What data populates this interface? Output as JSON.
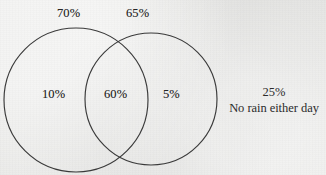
{
  "figure": {
    "name": "venn-diagram-rain-probability",
    "type": "venn-two-set",
    "background_color": "#ebebe9",
    "stroke_color": "#3a3a3a"
  },
  "labels": {
    "set_a_total": "70%",
    "set_b_total": "65%",
    "a_only": "10%",
    "intersection": "60%",
    "b_only": "5%",
    "outside_value": "25%",
    "outside_caption": "No rain either day"
  },
  "chart_data": {
    "type": "venn",
    "sets": [
      {
        "name": "set-a",
        "label": "70%",
        "total": 70,
        "only": 10
      },
      {
        "name": "set-b",
        "label": "65%",
        "total": 65,
        "only": 5
      }
    ],
    "intersection": 60,
    "outside": 25,
    "outside_label": "No rain either day",
    "units": "percent"
  },
  "geometry": {
    "left_circle": {
      "cx": 76,
      "cy": 100,
      "r": 72
    },
    "right_circle": {
      "cx": 151,
      "cy": 99,
      "r": 66
    }
  }
}
